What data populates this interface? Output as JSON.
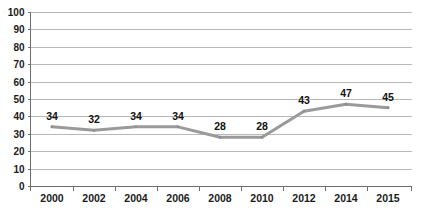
{
  "chart_data": {
    "type": "line",
    "title": "",
    "subtitle": "",
    "xlabel": "",
    "ylabel": "",
    "categories": [
      "2000",
      "2002",
      "2004",
      "2006",
      "2008",
      "2010",
      "2012",
      "2014",
      "2015"
    ],
    "values": [
      34,
      32,
      34,
      34,
      28,
      28,
      43,
      47,
      45
    ],
    "data_labels": [
      "34",
      "32",
      "34",
      "34",
      "28",
      "28",
      "43",
      "47",
      "45"
    ],
    "ylim": [
      0,
      100
    ],
    "ytick_step": 10,
    "yticks": [
      "0",
      "10",
      "20",
      "30",
      "40",
      "50",
      "60",
      "70",
      "80",
      "90",
      "100"
    ],
    "grid": true,
    "grid_axis": "y",
    "legend": false,
    "legend_position": "none",
    "series": [
      {
        "name": "",
        "values": [
          34,
          32,
          34,
          34,
          28,
          28,
          43,
          47,
          45
        ],
        "color": "#9a9a9a"
      }
    ],
    "annotations": []
  },
  "style": {
    "line_color": "#9a9a9a",
    "grid_color": "#b9b9b9",
    "axis_color": "#6e6e6e",
    "text_color": "#1a1a1a",
    "background": "#ffffff"
  }
}
